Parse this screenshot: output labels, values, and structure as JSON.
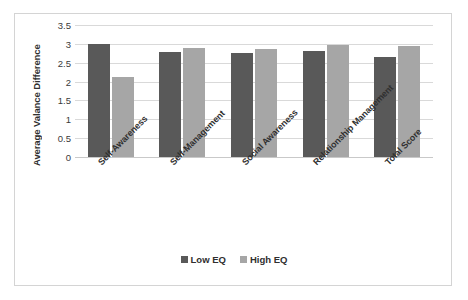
{
  "chart_data": {
    "type": "bar",
    "title": "",
    "subtitle": "",
    "xlabel": "",
    "ylabel": "Average Valance Difference",
    "ylim": [
      0,
      3.5
    ],
    "yticks": [
      0,
      0.5,
      1,
      1.5,
      2,
      2.5,
      3,
      3.5
    ],
    "ytick_labels": [
      "0",
      "0.5",
      "1",
      "1.5",
      "2",
      "2.5",
      "3",
      "3.5"
    ],
    "grid": true,
    "legend_position": "bottom",
    "categories": [
      "Self-Awareness",
      "Self-Management",
      "Social Awareness",
      "Relationship Management",
      "Total Score"
    ],
    "series": [
      {
        "name": "Low EQ",
        "color": "#595959",
        "values": [
          3.0,
          2.78,
          2.76,
          2.8,
          2.65
        ]
      },
      {
        "name": "High EQ",
        "color": "#a6a6a6",
        "values": [
          2.12,
          2.88,
          2.86,
          2.97,
          2.95
        ]
      }
    ]
  },
  "legend": {
    "items": [
      {
        "label": "Low EQ",
        "color": "#595959"
      },
      {
        "label": "High EQ",
        "color": "#a6a6a6"
      }
    ]
  },
  "colors": {
    "low_eq": "#595959",
    "high_eq": "#a6a6a6",
    "gridline": "#d9d9d9",
    "frame_border": "#d4d4d4",
    "text": "#2f2f2f",
    "background": "#ffffff"
  }
}
